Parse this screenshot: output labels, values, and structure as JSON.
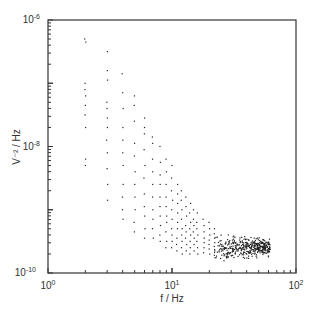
{
  "chart_data": {
    "type": "scatter",
    "title": "",
    "xlabel": "f / Hz",
    "ylabel": "V⁻² / Hz",
    "xscale": "log",
    "yscale": "log",
    "xlim": [
      1,
      100
    ],
    "ylim": [
      1e-10,
      1e-06
    ],
    "x_ticks": [
      {
        "value": 1,
        "label": "10",
        "exp": "0"
      },
      {
        "value": 10,
        "label": "10",
        "exp": "1"
      },
      {
        "value": 100,
        "label": "10",
        "exp": "2"
      }
    ],
    "y_ticks": [
      {
        "value": 1e-06,
        "label": "10",
        "exp": "-6"
      },
      {
        "value": 1e-08,
        "label": "10",
        "exp": "-8"
      },
      {
        "value": 1e-10,
        "label": "10",
        "exp": "-10"
      }
    ],
    "grid": false,
    "legend": null,
    "series": [
      {
        "name": "noise power spectral density",
        "color": "#222222",
        "columns": [
          {
            "f": 2,
            "logV": [
              -6.3,
              -6.35,
              -7.0,
              -7.1,
              -7.2,
              -7.35,
              -7.5,
              -7.7,
              -8.2,
              -8.3
            ]
          },
          {
            "f": 3,
            "logV": [
              -6.5,
              -6.8,
              -6.95,
              -7.3,
              -7.4,
              -7.55,
              -7.7,
              -7.9,
              -8.1,
              -8.35,
              -8.6,
              -8.85
            ]
          },
          {
            "f": 4,
            "logV": [
              -6.85,
              -7.15,
              -7.4,
              -7.7,
              -7.9,
              -8.1,
              -8.3,
              -8.6,
              -8.8,
              -9.0,
              -9.15
            ]
          },
          {
            "f": 5,
            "logV": [
              -7.2,
              -7.35,
              -7.6,
              -7.95,
              -8.15,
              -8.4,
              -8.6,
              -8.8,
              -9.0,
              -9.2,
              -9.35
            ]
          },
          {
            "f": 6,
            "logV": [
              -7.55,
              -7.7,
              -7.8,
              -8.05,
              -8.3,
              -8.5,
              -8.75,
              -8.95,
              -9.1,
              -9.3,
              -9.45
            ]
          },
          {
            "f": 7,
            "logV": [
              -7.85,
              -7.95,
              -8.2,
              -8.4,
              -8.6,
              -8.8,
              -9.0,
              -9.15,
              -9.3,
              -9.45
            ]
          },
          {
            "f": 8,
            "logV": [
              -8.0,
              -8.25,
              -8.45,
              -8.6,
              -8.8,
              -8.95,
              -9.1,
              -9.25,
              -9.4,
              -9.5
            ]
          },
          {
            "f": 9,
            "logV": [
              -8.2,
              -8.4,
              -8.6,
              -8.8,
              -8.95,
              -9.1,
              -9.2,
              -9.35,
              -9.5,
              -9.6
            ]
          },
          {
            "f": 10,
            "logV": [
              -8.3,
              -8.5,
              -8.7,
              -8.85,
              -9.0,
              -9.15,
              -9.3,
              -9.4,
              -9.5,
              -9.6
            ]
          },
          {
            "f": 11,
            "logV": [
              -8.6,
              -8.75,
              -8.9,
              -9.05,
              -9.2,
              -9.3,
              -9.45,
              -9.55,
              -9.65
            ]
          },
          {
            "f": 12,
            "logV": [
              -8.7,
              -8.85,
              -9.0,
              -9.15,
              -9.3,
              -9.4,
              -9.5,
              -9.6,
              -9.7
            ]
          },
          {
            "f": 13,
            "logV": [
              -8.8,
              -8.95,
              -9.1,
              -9.25,
              -9.35,
              -9.45,
              -9.55,
              -9.65
            ]
          },
          {
            "f": 14,
            "logV": [
              -8.9,
              -9.05,
              -9.2,
              -9.3,
              -9.4,
              -9.5,
              -9.6,
              -9.7
            ]
          },
          {
            "f": 15,
            "logV": [
              -9.0,
              -9.15,
              -9.25,
              -9.35,
              -9.45,
              -9.55,
              -9.65
            ]
          },
          {
            "f": 16,
            "logV": [
              -9.05,
              -9.2,
              -9.3,
              -9.4,
              -9.5,
              -9.6,
              -9.7
            ]
          },
          {
            "f": 18,
            "logV": [
              -9.15,
              -9.25,
              -9.35,
              -9.45,
              -9.52,
              -9.6,
              -9.68
            ]
          },
          {
            "f": 20,
            "logV": [
              -9.2,
              -9.3,
              -9.4,
              -9.48,
              -9.55,
              -9.62,
              -9.7
            ]
          },
          {
            "f": 22,
            "logV": [
              -9.3,
              -9.38,
              -9.45,
              -9.52,
              -9.58,
              -9.65,
              -9.72
            ]
          }
        ],
        "dense_band": {
          "f_min": 22,
          "f_max": 62,
          "logV_center": -9.6,
          "logV_spread": 0.12,
          "n_points": 420
        }
      }
    ]
  }
}
